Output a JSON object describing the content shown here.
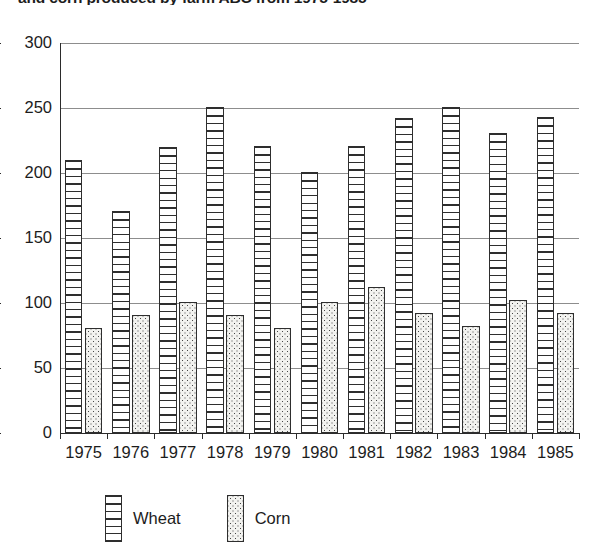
{
  "chart_data": {
    "type": "bar",
    "title": "and corn produced by farm ABC from 1975-1985",
    "title_note": "title is cropped at the top edge of the screenshot",
    "xlabel": "",
    "ylabel": "",
    "categories": [
      "1975",
      "1976",
      "1977",
      "1978",
      "1979",
      "1980",
      "1981",
      "1982",
      "1983",
      "1984",
      "1985"
    ],
    "series": [
      {
        "name": "Wheat",
        "pattern": "horizontal-stripes",
        "values": [
          210,
          171,
          220,
          251,
          221,
          201,
          221,
          242,
          251,
          231,
          243
        ]
      },
      {
        "name": "Corn",
        "pattern": "dotted",
        "values": [
          81,
          91,
          101,
          91,
          81,
          101,
          112,
          92,
          82,
          102,
          92
        ]
      }
    ],
    "ylim": [
      0,
      300
    ],
    "yticks": [
      0,
      50,
      100,
      150,
      200,
      250,
      300
    ],
    "ytick_labels": [
      "0",
      "50",
      "100",
      "150",
      "200",
      "250",
      "300"
    ],
    "grid": true,
    "grid_axis": "y",
    "legend_position": "bottom",
    "bar_group_mode": "grouped"
  },
  "legend": {
    "entries": [
      {
        "label": "Wheat",
        "swatch": "wheat-swatch"
      },
      {
        "label": "Corn",
        "swatch": "corn-swatch"
      }
    ]
  },
  "colors": {
    "ink": "#2e2e2e",
    "grid": "#8d8d8d",
    "background": "#ffffff",
    "corn_fill": "#f2f2ef"
  }
}
